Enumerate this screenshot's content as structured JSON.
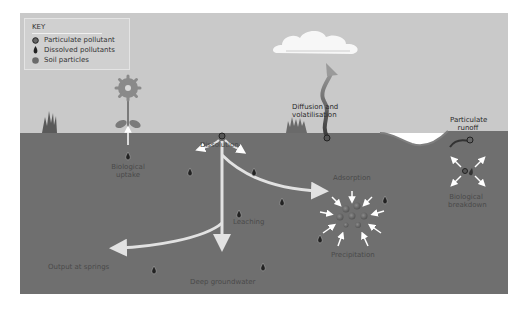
{
  "key": {
    "title": "KEY",
    "items": [
      {
        "icon": "particulate-pollutant-icon",
        "label": "Particulate pollutant"
      },
      {
        "icon": "dissolved-pollutant-icon",
        "label": "Dissolved pollutants"
      },
      {
        "icon": "soil-particle-icon",
        "label": "Soil particles"
      }
    ]
  },
  "labels": {
    "biological_uptake_1": "Biological",
    "biological_uptake_2": "uptake",
    "dissolution": "Dissolution",
    "leaching": "Leaching",
    "diffusion_1": "Diffusion and",
    "diffusion_2": "volatilisation",
    "particulate_runoff_1": "Particulate",
    "particulate_runoff_2": "runoff",
    "adsorption": "Adsorption",
    "precipitation": "Precipitation",
    "biological_breakdown_1": "Biological",
    "biological_breakdown_2": "breakdown",
    "output_springs": "Output at springs",
    "deep_groundwater": "Deep groundwater"
  },
  "colors": {
    "sky": "#c9c9c9",
    "ground": "#6f6f6f",
    "arrow": "#e2e2e2",
    "cloud": "#f7f7f7",
    "flower": "#8a8a8a",
    "soil_particle": "#6a6a6a"
  }
}
